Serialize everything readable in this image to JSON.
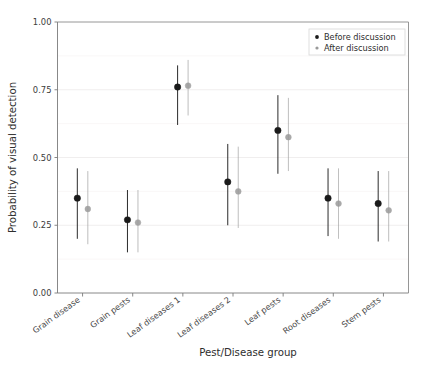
{
  "chart_data": {
    "type": "scatter",
    "title": "",
    "xlabel": "Pest/Disease group",
    "ylabel": "Probability of visual detection",
    "ylim": [
      0.0,
      1.0
    ],
    "ytick_labels": [
      "0.00",
      "0.25",
      "0.50",
      "0.75",
      "1.00"
    ],
    "ytick_values": [
      0.0,
      0.25,
      0.5,
      0.75,
      1.0
    ],
    "grid": true,
    "grid_axis": "y",
    "legend_position": "top-right",
    "categories": [
      "Grain disease",
      "Grain pests",
      "Leaf diseases 1",
      "Leaf diseases 2",
      "Leaf pests",
      "Root diseases",
      "Stem pests"
    ],
    "series": [
      {
        "name": "Before discussion",
        "color": "#1a1a1a",
        "marker": "circle",
        "values": [
          0.35,
          0.27,
          0.76,
          0.41,
          0.6,
          0.35,
          0.33
        ],
        "error_low": [
          0.2,
          0.15,
          0.62,
          0.25,
          0.44,
          0.21,
          0.19
        ],
        "error_high": [
          0.46,
          0.38,
          0.84,
          0.55,
          0.73,
          0.46,
          0.45
        ]
      },
      {
        "name": "After discussion",
        "color": "#9a9a9a",
        "marker": "circle",
        "values": [
          0.31,
          0.26,
          0.765,
          0.375,
          0.575,
          0.33,
          0.305
        ],
        "error_low": [
          0.18,
          0.15,
          0.655,
          0.24,
          0.45,
          0.2,
          0.19
        ],
        "error_high": [
          0.45,
          0.38,
          0.86,
          0.54,
          0.72,
          0.46,
          0.45
        ]
      }
    ]
  },
  "legend": {
    "entries": [
      {
        "label": "Before discussion",
        "color": "#1a1a1a"
      },
      {
        "label": "After discussion",
        "color": "#9a9a9a"
      }
    ]
  },
  "axis": {
    "y_title": "Probability of visual detection",
    "x_title": "Pest/Disease group"
  }
}
